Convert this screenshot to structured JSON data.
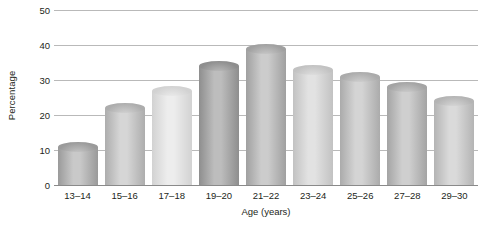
{
  "chart_data": {
    "type": "bar",
    "title": "",
    "subtitle": "",
    "xlabel": "Age (years)",
    "ylabel": "Percentage",
    "categories": [
      "13–14",
      "15–16",
      "17–18",
      "19–20",
      "21–22",
      "23–24",
      "25–26",
      "27–28",
      "29–30"
    ],
    "values": [
      11,
      22,
      27,
      34,
      39,
      33,
      31,
      28,
      24
    ],
    "ylim": [
      0,
      50
    ],
    "yticks": [
      0,
      10,
      20,
      30,
      40,
      50
    ],
    "ytick_labels": [
      "0",
      "10",
      "20",
      "30",
      "40",
      "50"
    ],
    "grid": true,
    "legend": null,
    "legend_position": "none",
    "bar_style": "3d-cylinder-grayscale",
    "series": [
      {
        "name": "Percentage",
        "values": [
          11,
          22,
          27,
          34,
          39,
          33,
          31,
          28,
          24
        ]
      }
    ],
    "bar_colors": [
      {
        "category": "13–14",
        "top": "#9a9a9a",
        "bottom": "#c9c9c9"
      },
      {
        "category": "15–16",
        "top": "#adadad",
        "bottom": "#d6d6d6"
      },
      {
        "category": "17–18",
        "top": "#d2d2d2",
        "bottom": "#ededed"
      },
      {
        "category": "19–20",
        "top": "#8e8e8e",
        "bottom": "#bdbdbd"
      },
      {
        "category": "21–22",
        "top": "#a0a0a0",
        "bottom": "#cccccc"
      },
      {
        "category": "23–24",
        "top": "#c2c2c2",
        "bottom": "#e2e2e2"
      },
      {
        "category": "25–26",
        "top": "#ababab",
        "bottom": "#d4d4d4"
      },
      {
        "category": "27–28",
        "top": "#a4a4a4",
        "bottom": "#cfcfcf"
      },
      {
        "category": "29–30",
        "top": "#b4b4b4",
        "bottom": "#dadada"
      }
    ],
    "axis_color": "#b9b9b9",
    "text_color": "#231f20",
    "background": "#ffffff"
  }
}
